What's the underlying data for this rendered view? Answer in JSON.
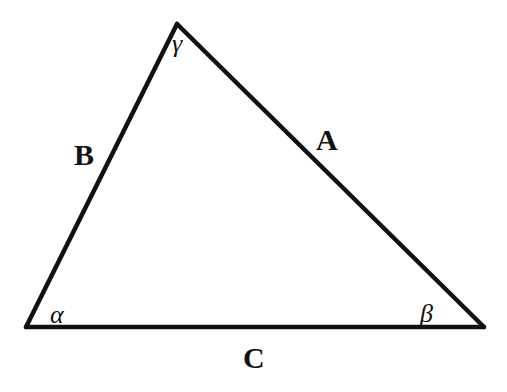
{
  "diagram": {
    "type": "triangle",
    "vertices": {
      "top": {
        "x": 177,
        "y": 24
      },
      "bottom_left": {
        "x": 26,
        "y": 327
      },
      "bottom_right": {
        "x": 484,
        "y": 327
      }
    },
    "sides": {
      "A": {
        "label": "A",
        "between": [
          "top",
          "bottom_right"
        ]
      },
      "B": {
        "label": "B",
        "between": [
          "top",
          "bottom_left"
        ]
      },
      "C": {
        "label": "C",
        "between": [
          "bottom_left",
          "bottom_right"
        ]
      }
    },
    "angles": {
      "alpha": {
        "label": "α",
        "at": "bottom_left"
      },
      "beta": {
        "label": "β",
        "at": "bottom_right"
      },
      "gamma": {
        "label": "γ",
        "at": "top"
      }
    },
    "colors": {
      "stroke": "#111111",
      "background": "#ffffff"
    }
  }
}
